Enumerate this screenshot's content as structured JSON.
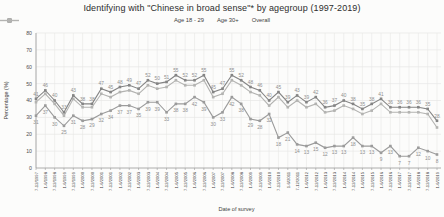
{
  "chart_data": {
    "type": "line",
    "title": "Identifying with \"Chinese in broad sense\"* by agegroup (1997-2019)",
    "xlabel": "Date of survey",
    "ylabel": "Percentage (%)",
    "ylim": [
      0,
      80
    ],
    "yticks": [
      0,
      10,
      20,
      30,
      40,
      50,
      60,
      70,
      80
    ],
    "grid": true,
    "legend_position": "top-center",
    "marker": "square",
    "background_color": "#fcfcfb",
    "gridline_color": "#e7e7e5",
    "axis_color": "#9a9a9a",
    "label_color": "#8f8f8f",
    "categories": [
      "7-12/1997",
      "1-6/1998",
      "7-12/1998",
      "1-6/1999",
      "7-12/1999",
      "1-6/2000",
      "7-12/2000",
      "1-6/2001",
      "7-12/2001",
      "1-6/2002",
      "7-12/2002",
      "1-6/2003",
      "7-12/2003",
      "1-6/2004",
      "7-12/2004",
      "1-6/2005",
      "7-12/2005",
      "1-6/2006",
      "7-12/2006",
      "1-6/2007",
      "7-12/2007",
      "1-6/2008",
      "7-12/2008",
      "1-6/2009",
      "7-12/2009",
      "1-6/2010",
      "7-12/2010",
      "1-6/2011",
      "7-12/2011",
      "1-6/2012",
      "7-12/2012",
      "1-6/2013",
      "7-12/2013",
      "1-6/2014",
      "7-12/2014",
      "1-6/2015",
      "7-12/2015",
      "1-6/2016",
      "7-12/2016",
      "1-6/2017",
      "7-12/2017",
      "1-6/2018",
      "7-12/2018",
      "1-6/2019"
    ],
    "series": [
      {
        "name": "Age 18 - 29",
        "color": "#9b9b9b",
        "show_labels": true,
        "label_side": "below",
        "values": [
          31,
          37,
          30,
          25,
          31,
          28,
          29,
          32,
          34,
          37,
          37,
          35,
          39,
          39,
          33,
          38,
          38,
          42,
          39,
          30,
          33,
          42,
          38,
          29,
          28,
          32,
          18,
          21,
          14,
          13,
          15,
          12,
          13,
          13,
          18,
          13,
          13,
          9,
          13,
          7,
          7,
          12,
          10,
          8
        ]
      },
      {
        "name": "Age 30+",
        "color": "#848484",
        "show_labels": true,
        "label_side": "above",
        "values": [
          41,
          46,
          40,
          33,
          43,
          38,
          38,
          47,
          45,
          48,
          49,
          47,
          52,
          50,
          51,
          55,
          52,
          52,
          55,
          45,
          47,
          55,
          52,
          48,
          46,
          40,
          45,
          39,
          43,
          39,
          42,
          36,
          37,
          40,
          38,
          35,
          38,
          41,
          36,
          36,
          36,
          36,
          35,
          28
        ]
      },
      {
        "name": "Overall",
        "color": "#b3b3b1",
        "show_labels": false,
        "label_side": "above",
        "values": [
          39,
          44,
          38,
          31,
          41,
          36,
          36,
          44,
          42,
          45,
          46,
          44,
          49,
          47,
          48,
          52,
          49,
          49,
          52,
          42,
          44,
          52,
          49,
          45,
          43,
          37,
          42,
          36,
          40,
          36,
          38,
          33,
          34,
          37,
          35,
          32,
          34,
          38,
          33,
          33,
          33,
          33,
          32,
          24
        ]
      }
    ]
  }
}
